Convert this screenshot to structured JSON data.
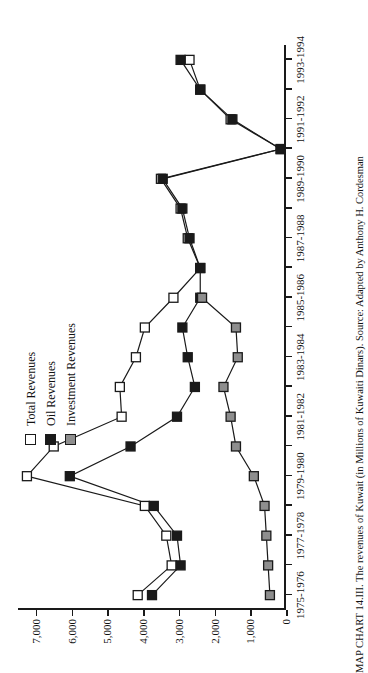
{
  "figure": {
    "caption": "MAP CHART 14.III. The revenues of Kuwait (in Millions of Kuwaiti Dinars). Source: Adapted by Anthony H. Cordesman"
  },
  "legend": {
    "position": "upper-left",
    "items": [
      {
        "label": "Total Revenues",
        "marker": "open-square",
        "color": "#ffffff"
      },
      {
        "label": "Oil Revenues",
        "marker": "filled-square",
        "color": "#1a1a1a"
      },
      {
        "label": "Investment Revenues",
        "marker": "gray-square",
        "color": "#8e8e8e"
      }
    ]
  },
  "chart_data": {
    "type": "line",
    "title": "",
    "subtitle": "",
    "xlabel": "",
    "ylabel": "",
    "ylim": [
      0,
      7500
    ],
    "grid": false,
    "legend_position": "upper-left",
    "y_ticks": [
      0,
      1000,
      2000,
      3000,
      4000,
      5000,
      6000,
      7000
    ],
    "y_tick_labels": [
      "0",
      "1,000",
      "2,000",
      "3,000",
      "4,000",
      "5,000",
      "6,000",
      "7,000"
    ],
    "x": [
      "1975-1976",
      "1976-1977",
      "1977-1978",
      "1978-1979",
      "1979-1980",
      "1980-1981",
      "1981-1982",
      "1982-1983",
      "1983-1984",
      "1984-1985",
      "1985-1986",
      "1986-1987",
      "1987-1988",
      "1988-1989",
      "1989-1990",
      "1990-1991",
      "1991-1992",
      "1992-1993",
      "1993-1994"
    ],
    "x_tick_labels": [
      "1975-1976",
      "",
      "1977-1978",
      "",
      "1979-1980",
      "",
      "1981-1982",
      "",
      "1983-1984",
      "",
      "1985-1986",
      "",
      "1987-1988",
      "",
      "1989-1990",
      "",
      "1991-1992",
      "",
      "1993-1994"
    ],
    "series": [
      {
        "name": "Total Revenues",
        "marker": "open-square",
        "values": [
          4150,
          3200,
          3350,
          3950,
          7250,
          6500,
          4600,
          4650,
          4200,
          3950,
          3150,
          2400,
          2750,
          2950,
          3500,
          150,
          1550,
          2400,
          2700
        ]
      },
      {
        "name": "Oil Revenues",
        "marker": "filled-square",
        "values": [
          3750,
          2950,
          3050,
          3700,
          6050,
          4350,
          3050,
          2550,
          2750,
          2900,
          2400,
          2400,
          2700,
          2900,
          3450,
          150,
          1500,
          2400,
          2950
        ]
      },
      {
        "name": "Investment Revenues",
        "marker": "gray-square",
        "values": [
          450,
          500,
          550,
          600,
          900,
          1400,
          1550,
          1750,
          1350,
          1400,
          2350,
          null,
          null,
          null,
          null,
          null,
          null,
          null,
          null
        ]
      }
    ]
  }
}
